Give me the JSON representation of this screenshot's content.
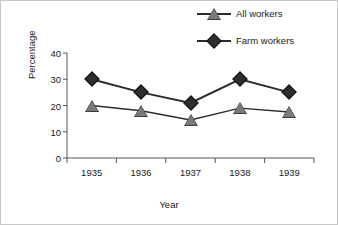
{
  "chart_data": {
    "type": "line",
    "title": "",
    "xlabel": "Year",
    "ylabel": "Percentage",
    "categories": [
      "1935",
      "1936",
      "1937",
      "1938",
      "1939"
    ],
    "series": [
      {
        "name": "All workers",
        "marker": "triangle",
        "color": "#7a7a7a",
        "values": [
          20,
          18,
          14.5,
          19,
          17.5
        ]
      },
      {
        "name": "Farm workers",
        "marker": "diamond",
        "color": "#2e2e2e",
        "values": [
          30,
          25,
          21,
          30,
          25
        ]
      }
    ],
    "ylim": [
      0,
      40
    ],
    "yticks": [
      "0",
      "10",
      "20",
      "30",
      "40"
    ],
    "grid": false,
    "legend_position": "top-right"
  },
  "legend": {
    "items": [
      {
        "label": "All workers"
      },
      {
        "label": "Farm workers"
      }
    ]
  },
  "axes": {
    "y_title": "Percentage",
    "x_title": "Year"
  },
  "colors": {
    "line": "#2b2b2b",
    "all_workers_marker": "#7a7a7a",
    "farm_workers_marker": "#2e2e2e",
    "axis": "#555555",
    "background": "#ffffff"
  }
}
